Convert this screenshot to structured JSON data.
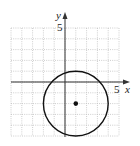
{
  "chart_data": {
    "type": "scatter",
    "title": "",
    "xlabel": "x",
    "ylabel": "y",
    "xlim": [
      -5,
      5
    ],
    "ylim": [
      -5,
      5
    ],
    "grid": true,
    "grid_step": 1,
    "major_grid_step": 5,
    "tick_labels": {
      "x": [
        "5"
      ],
      "y": [
        "5"
      ]
    },
    "shapes": [
      {
        "kind": "circle",
        "center": [
          1,
          -2
        ],
        "radius": 3,
        "stroke": "#111111"
      }
    ],
    "points": [
      {
        "x": 1,
        "y": -2,
        "label": "center"
      }
    ]
  },
  "labels": {
    "x_axis": "x",
    "y_axis": "y",
    "x_tick": "5",
    "y_tick": "5"
  },
  "colors": {
    "grid": "#b8b8b8",
    "axis": "#333333",
    "curve": "#111111"
  }
}
